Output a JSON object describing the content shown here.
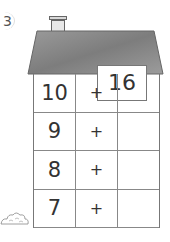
{
  "exercise": {
    "number": "3",
    "roof_total": "16",
    "rows": [
      {
        "left": "10",
        "operator": "+",
        "answer": ""
      },
      {
        "left": "9",
        "operator": "+",
        "answer": ""
      },
      {
        "left": "8",
        "operator": "+",
        "answer": ""
      },
      {
        "left": "7",
        "operator": "+",
        "answer": ""
      }
    ]
  },
  "colors": {
    "roof_gray": "#8a8a8a",
    "line": "#777777",
    "text": "#333333"
  }
}
